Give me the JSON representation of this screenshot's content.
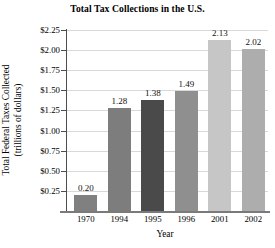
{
  "chart_data": {
    "type": "bar",
    "title": "Total Tax Collections in the U.S.",
    "xlabel": "Year",
    "ylabel_line1": "Total Federal Taxes Collected",
    "ylabel_line2": "(trillions of dollars)",
    "categories": [
      "1970",
      "1994",
      "1995",
      "1996",
      "2001",
      "2002"
    ],
    "values": [
      0.2,
      1.28,
      1.38,
      1.49,
      2.13,
      2.02
    ],
    "value_labels": [
      "0.20",
      "1.28",
      "1.38",
      "1.49",
      "2.13",
      "2.02"
    ],
    "bar_colors": [
      "#808080",
      "#7d7d7d",
      "#4a4a4a",
      "#8f8f8f",
      "#c6c6c6",
      "#adadad"
    ],
    "ylim": [
      0.0,
      2.25
    ],
    "ytick_values": [
      0.25,
      0.5,
      0.75,
      1.0,
      1.25,
      1.5,
      1.75,
      2.0,
      2.25
    ],
    "ytick_labels": [
      "$0.25",
      "$0.50",
      "$0.75",
      "$1.00",
      "$1.25",
      "$1.50",
      "$1.75",
      "$2.00",
      "$2.25"
    ],
    "grid": true,
    "grid_color": "#d9d9d9",
    "legend": null,
    "legend_position": "none",
    "axis_color": "#4d4d4d",
    "background": "#ffffff"
  }
}
